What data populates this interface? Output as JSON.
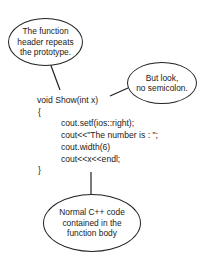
{
  "callouts": {
    "header": {
      "lines": [
        "The function",
        "header repeats",
        "the prototype."
      ]
    },
    "semicolon": {
      "lines": [
        "But look,",
        "no semicolon."
      ]
    },
    "body": {
      "lines": [
        "Normal C++ code",
        "contained in the",
        "function body"
      ]
    }
  },
  "code": {
    "signature": "void Show(int x)",
    "open_brace": "{",
    "body_lines": [
      "cout.setf(ios::right);",
      "cout<<\"The number is : \";",
      "cout.width(6)",
      "cout<<x<<endl;"
    ],
    "close_brace": "}"
  }
}
